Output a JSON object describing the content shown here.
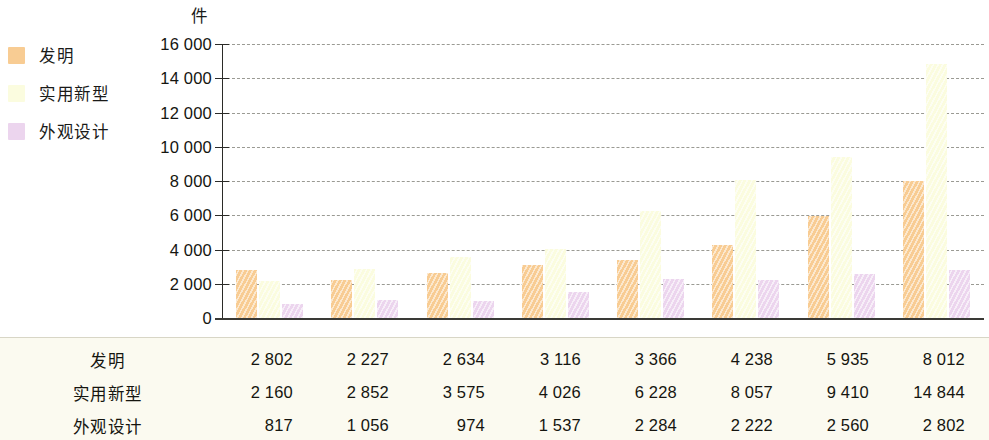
{
  "unit_label": "件",
  "legend": {
    "items": [
      {
        "label": "发明",
        "color": "#f8cc93"
      },
      {
        "label": "实用新型",
        "color": "#fbfcdf"
      },
      {
        "label": "外观设计",
        "color": "#ecd5ee"
      }
    ]
  },
  "axis": {
    "y_tick_labels": [
      "16 000",
      "14 000",
      "12 000",
      "10 000",
      "8 000",
      "6 000",
      "4 000",
      "2 000",
      "0"
    ],
    "y_tick_values": [
      16000,
      14000,
      12000,
      10000,
      8000,
      6000,
      4000,
      2000,
      0
    ]
  },
  "table": {
    "rows": [
      {
        "label": "发明",
        "values": [
          "2 802",
          "2 227",
          "2 634",
          "3 116",
          "3 366",
          "4 238",
          "5 935",
          "8 012"
        ]
      },
      {
        "label": "实用新型",
        "values": [
          "2 160",
          "2 852",
          "3 575",
          "4 026",
          "6 228",
          "8 057",
          "9 410",
          "14 844"
        ]
      },
      {
        "label": "外观设计",
        "values": [
          "817",
          "1 056",
          "974",
          "1 537",
          "2 284",
          "2 222",
          "2 560",
          "2 802"
        ]
      }
    ]
  },
  "chart_data": {
    "type": "bar",
    "title": "",
    "xlabel": "",
    "ylabel": "件",
    "ylim": [
      0,
      16000
    ],
    "grid": true,
    "legend_position": "left",
    "categories": [
      "2006",
      "2007",
      "2008",
      "2009",
      "2010",
      "2011",
      "2012",
      "2013"
    ],
    "series": [
      {
        "name": "发明",
        "color": "#f8cc93",
        "values": [
          2802,
          2227,
          2634,
          3116,
          3366,
          4238,
          5935,
          8012
        ]
      },
      {
        "name": "实用新型",
        "color": "#fbfcdf",
        "values": [
          2160,
          2852,
          3575,
          4026,
          6228,
          8057,
          9410,
          14844
        ]
      },
      {
        "name": "外观设计",
        "color": "#ecd5ee",
        "values": [
          817,
          1056,
          974,
          1537,
          2284,
          2222,
          2560,
          2802
        ]
      }
    ]
  }
}
